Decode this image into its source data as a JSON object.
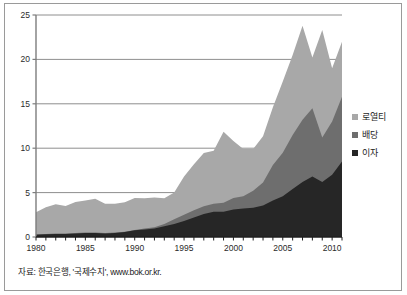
{
  "figure": {
    "source_note": "자료: 한국은행, '국제수지', www.bok.or.kr.",
    "border_color": "#9a9a9a",
    "background": "#ffffff"
  },
  "legend": {
    "position": "right",
    "items": [
      {
        "label": "로열티",
        "color": "#a8a8a8",
        "name": "royalty"
      },
      {
        "label": "배당",
        "color": "#6e6e6e",
        "name": "dividend"
      },
      {
        "label": "이자",
        "color": "#262626",
        "name": "interest"
      }
    ]
  },
  "axes": {
    "y_ticks": [
      "0",
      "5",
      "10",
      "15",
      "20",
      "25"
    ],
    "x_ticks": [
      "1980",
      "1985",
      "1990",
      "1995",
      "2000",
      "2005",
      "2010"
    ],
    "grid": true,
    "gridline_color": "#8e8e8e",
    "axis_color": "#7d7d7d"
  },
  "chart_data": {
    "type": "area",
    "stacked": true,
    "title": "",
    "xlabel": "",
    "ylabel": "",
    "ylim": [
      0,
      25
    ],
    "xlim": [
      1980,
      2011
    ],
    "grid": true,
    "legend_position": "right",
    "x": [
      1980,
      1981,
      1982,
      1983,
      1984,
      1985,
      1986,
      1987,
      1988,
      1989,
      1990,
      1991,
      1992,
      1993,
      1994,
      1995,
      1996,
      1997,
      1998,
      1999,
      2000,
      2001,
      2002,
      2003,
      2004,
      2005,
      2006,
      2007,
      2008,
      2009,
      2010,
      2011
    ],
    "series": [
      {
        "name": "이자",
        "color": "#262626",
        "values": [
          0.25,
          0.3,
          0.35,
          0.35,
          0.4,
          0.45,
          0.45,
          0.4,
          0.45,
          0.55,
          0.75,
          0.85,
          0.95,
          1.2,
          1.45,
          1.8,
          2.2,
          2.6,
          2.85,
          2.85,
          3.1,
          3.2,
          3.3,
          3.55,
          4.1,
          4.6,
          5.4,
          6.2,
          6.8,
          6.2,
          7.0,
          8.5
        ]
      },
      {
        "name": "배당",
        "color": "#6e6e6e",
        "values": [
          0.05,
          0.05,
          0.05,
          0.05,
          0.05,
          0.05,
          0.05,
          0.05,
          0.05,
          0.05,
          0.05,
          0.1,
          0.15,
          0.25,
          0.55,
          0.7,
          0.8,
          0.85,
          0.9,
          1.0,
          1.3,
          1.4,
          1.9,
          2.6,
          4.0,
          4.9,
          6.1,
          7.0,
          7.7,
          5.0,
          6.0,
          7.3
        ]
      },
      {
        "name": "로열티",
        "color": "#a8a8a8",
        "values": [
          2.5,
          3.0,
          3.3,
          3.1,
          3.5,
          3.6,
          3.8,
          3.3,
          3.25,
          3.3,
          3.6,
          3.4,
          3.35,
          2.9,
          3.0,
          4.3,
          5.2,
          6.0,
          5.95,
          8.0,
          6.4,
          5.3,
          4.7,
          5.2,
          6.5,
          8.0,
          9.0,
          10.6,
          5.7,
          12.1,
          6.0,
          6.2
        ]
      }
    ],
    "totals": [
      2.8,
      3.35,
      3.7,
      3.5,
      3.95,
      4.1,
      4.3,
      3.75,
      3.75,
      3.9,
      4.4,
      4.35,
      4.45,
      4.35,
      5.0,
      6.8,
      8.2,
      9.45,
      9.7,
      11.85,
      10.8,
      9.9,
      9.9,
      11.35,
      14.6,
      17.5,
      20.5,
      23.8,
      20.2,
      23.3,
      19.0,
      22.0
    ]
  }
}
